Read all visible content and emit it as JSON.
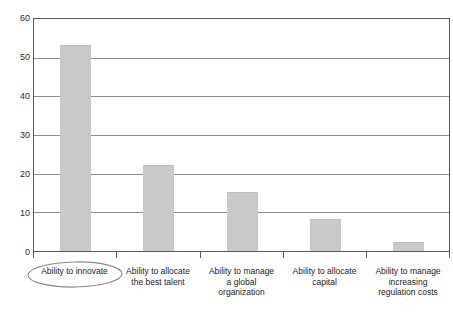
{
  "chart_data": {
    "type": "bar",
    "title": "",
    "xlabel": "",
    "ylabel": "",
    "categories": [
      "Ability to innovate",
      "Ability to allocate the best talent",
      "Ability to manage a global organization",
      "Ability to allocate capital",
      "Ability to manage increasing regulation costs"
    ],
    "category_lines": [
      [
        "Ability to innovate"
      ],
      [
        "Ability to allocate",
        "the best talent"
      ],
      [
        "Ability to manage",
        "a global",
        "organization"
      ],
      [
        "Ability to allocate",
        "capital"
      ],
      [
        "Ability to manage",
        "increasing",
        "regulation costs"
      ]
    ],
    "values": [
      53,
      22,
      15,
      8,
      2
    ],
    "ylim": [
      0,
      60
    ],
    "yticks": [
      0,
      10,
      20,
      30,
      40,
      50,
      60
    ],
    "ytick_labels": [
      "0",
      "10",
      "20",
      "30",
      "40",
      "50",
      "60"
    ],
    "grid": true,
    "legend": false,
    "annotations": [
      {
        "type": "ellipse",
        "target": "Ability to innovate",
        "note": "hand-drawn ellipse circling the first category label"
      }
    ],
    "colors": {
      "bar_fill": "#c9c9c9",
      "gridline": "#8e8e8e",
      "axis": "#5a5a5a",
      "text": "#1c1c1c",
      "annotation": "#8a8a8a"
    }
  },
  "caption": {
    "text": ""
  }
}
